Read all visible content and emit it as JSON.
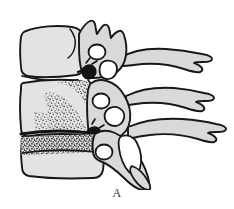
{
  "figure": {
    "label": "A",
    "caption_position": "bottom-center",
    "background_color": "#ffffff",
    "view": "lateral"
  },
  "palette": {
    "bone_fill": "#d9d9d9",
    "body_fill": "#e3e3e3",
    "outline": "#1a1a1a",
    "foramen_fill": "#ffffff",
    "stipple": "#303030",
    "endplate_dark": "#141414",
    "label_color": "#3a3a3a"
  },
  "anatomy": {
    "vertebrae": [
      {
        "name": "upper-vertebra",
        "level": "superior",
        "body_state": "intact",
        "body_fill": "#e3e3e3",
        "has_transverse_foramen": true,
        "spinous_process": "bifid"
      },
      {
        "name": "middle-vertebra",
        "level": "middle",
        "body_state": "wedge-compression-fracture",
        "body_fill": "#e3e3e3",
        "texture": "stippled",
        "has_transverse_foramen": true,
        "spinous_process": "bifid"
      },
      {
        "name": "lower-vertebra",
        "level": "inferior",
        "body_state": "superior-endplate-fracture",
        "body_fill": "#e3e3e3",
        "texture": "stippled-band",
        "has_transverse_foramen": true,
        "spinous_process": "bifid"
      }
    ],
    "features": [
      {
        "name": "vertebral-body",
        "count": 3
      },
      {
        "name": "transverse-foramen",
        "count": 3
      },
      {
        "name": "spinous-process",
        "count": 3
      },
      {
        "name": "superior-articular-process",
        "count": 3
      },
      {
        "name": "intervertebral-disc-space",
        "count": 2
      },
      {
        "name": "facet-joint",
        "count": 2
      },
      {
        "name": "fracture-fragment",
        "count": 2
      }
    ]
  }
}
